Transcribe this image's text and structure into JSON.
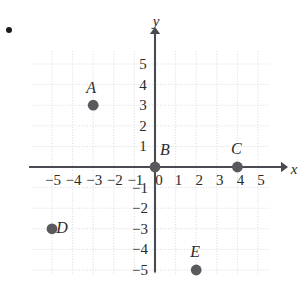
{
  "figure": {
    "kind": "coordinate-plane",
    "bullet_marker": "•",
    "axes": {
      "x_label": "x",
      "y_label": "y",
      "x_ticks": [
        "-5",
        "-4",
        "-3",
        "-2",
        "-1",
        "0",
        "1",
        "2",
        "3",
        "4",
        "5"
      ],
      "y_ticks_positive": [
        "5",
        "4",
        "3",
        "2",
        "1"
      ],
      "y_ticks_negative": [
        "-1",
        "-2",
        "-3",
        "-4",
        "-5"
      ],
      "xlim": [
        -5,
        5
      ],
      "ylim": [
        -5,
        5
      ],
      "grid": true,
      "grid_color": "#d9d9e2",
      "axis_color": "#4a4a52"
    },
    "point_color": "#5a5a5e",
    "points": [
      {
        "name": "A",
        "x": -3,
        "y": 3,
        "label_dx": -2,
        "label_dy": -17
      },
      {
        "name": "B",
        "x": 0,
        "y": 0,
        "label_dx": 10,
        "label_dy": -17
      },
      {
        "name": "C",
        "x": 4,
        "y": 0,
        "label_dx": -1,
        "label_dy": -18
      },
      {
        "name": "D",
        "x": -5,
        "y": -3,
        "label_dx": 10,
        "label_dy": -1
      },
      {
        "name": "E",
        "x": 2,
        "y": -5,
        "label_dx": -1,
        "label_dy": -18
      }
    ]
  },
  "chart_data": {
    "type": "scatter",
    "title": "",
    "xlabel": "x",
    "ylabel": "y",
    "xlim": [
      -5,
      5
    ],
    "ylim": [
      -5,
      5
    ],
    "grid": true,
    "legend": "none",
    "x_tick_labels": [
      "-5",
      "-4",
      "-3",
      "-2",
      "-1",
      "0",
      "1",
      "2",
      "3",
      "4",
      "5"
    ],
    "y_tick_labels": [
      "-5",
      "-4",
      "-3",
      "-2",
      "-1",
      "1",
      "2",
      "3",
      "4",
      "5"
    ],
    "annotations": [
      "A",
      "B",
      "C",
      "D",
      "E"
    ],
    "points": [
      {
        "label": "A",
        "x": -3,
        "y": 3
      },
      {
        "label": "B",
        "x": 0,
        "y": 0
      },
      {
        "label": "C",
        "x": 4,
        "y": 0
      },
      {
        "label": "D",
        "x": -5,
        "y": -3
      },
      {
        "label": "E",
        "x": 2,
        "y": -5
      }
    ]
  }
}
